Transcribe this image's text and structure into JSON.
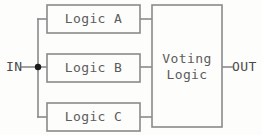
{
  "diagram": {
    "background_color": "#fdfdfc",
    "line_color": "#8a8a8a",
    "text_color": "#5b5b5b",
    "junction_color": "#1b1b1b",
    "ports": {
      "input": {
        "label": "IN",
        "x": 6,
        "y": 67
      },
      "output": {
        "label": "OUT",
        "x": 232,
        "y": 67
      }
    },
    "junction": {
      "name": "input-fanout-node",
      "x": 38,
      "y": 67,
      "radius": 3.2
    },
    "blocks": [
      {
        "id": "logic-a",
        "label": "Logic A",
        "x": 47,
        "y": 5,
        "width": 93,
        "height": 28,
        "center_x": 93.5,
        "center_y": 19.5
      },
      {
        "id": "logic-b",
        "label": "Logic B",
        "x": 47,
        "y": 54,
        "width": 93,
        "height": 28,
        "center_x": 93.5,
        "center_y": 68.5
      },
      {
        "id": "logic-c",
        "label": "Logic C",
        "x": 47,
        "y": 103,
        "width": 93,
        "height": 28,
        "center_x": 93.5,
        "center_y": 117.5
      },
      {
        "id": "voting-logic",
        "label_line1": "Voting",
        "label_line2": "Logic",
        "x": 152,
        "y": 5,
        "width": 70,
        "height": 122,
        "center_x": 187,
        "center_y": 66,
        "line1_y": 59,
        "line2_y": 75
      }
    ],
    "wires": [
      {
        "name": "in-to-node",
        "d": "M 22 67 L 38 67"
      },
      {
        "name": "bus-vertical",
        "d": "M 38 19 L 38 117"
      },
      {
        "name": "node-to-logic-a",
        "d": "M 38 19 L 47 19"
      },
      {
        "name": "node-to-logic-b",
        "d": "M 38 67 L 47 67"
      },
      {
        "name": "node-to-logic-c",
        "d": "M 38 117 L 47 117"
      },
      {
        "name": "logic-a-to-voter",
        "d": "M 140 19 L 152 19"
      },
      {
        "name": "logic-b-to-voter",
        "d": "M 140 67 L 152 67"
      },
      {
        "name": "logic-c-to-voter",
        "d": "M 140 117 L 152 117"
      },
      {
        "name": "voter-to-out",
        "d": "M 222 67 L 232 67"
      }
    ]
  }
}
